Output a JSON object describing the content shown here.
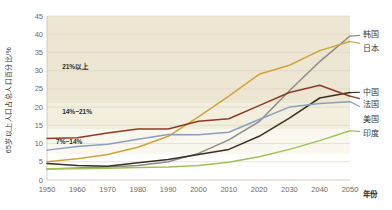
{
  "chart_data": {
    "type": "line",
    "title": "",
    "xlabel": "年份",
    "ylabel": "65岁以上人口占总人口百分比/%",
    "xlim": [
      1950,
      2050
    ],
    "ylim": [
      0,
      45
    ],
    "x": [
      1950,
      1960,
      1970,
      1980,
      1990,
      2000,
      2010,
      2020,
      2030,
      2040,
      2050
    ],
    "xticks": [
      "1950",
      "1960",
      "1970",
      "1980",
      "1990",
      "2000",
      "2010",
      "2020",
      "2030",
      "2040",
      "2050"
    ],
    "yticks": [
      "0",
      "5",
      "10",
      "15",
      "20",
      "25",
      "30",
      "35",
      "40",
      "45"
    ],
    "grid": true,
    "legend_position": "right",
    "series": [
      {
        "name": "韩国",
        "color": "#8d8b85",
        "values": [
          3.0,
          3.3,
          3.6,
          4.0,
          5.0,
          7.3,
          11.0,
          16.0,
          24.5,
          32.5,
          39.5
        ]
      },
      {
        "name": "日本",
        "color": "#d1a23c",
        "values": [
          5.0,
          5.8,
          7.0,
          9.0,
          12.0,
          17.3,
          23.0,
          29.0,
          31.5,
          35.5,
          38.0
        ]
      },
      {
        "name": "中国",
        "color": "#3a2f22",
        "values": [
          4.5,
          4.0,
          3.8,
          4.7,
          5.6,
          7.0,
          8.4,
          12.0,
          17.0,
          22.5,
          24.0
        ]
      },
      {
        "name": "法国",
        "color": "#8c3b22",
        "values": [
          11.4,
          11.6,
          12.9,
          14.0,
          14.0,
          16.1,
          16.8,
          20.4,
          24.0,
          26.0,
          23.0
        ]
      },
      {
        "name": "美国",
        "color": "#8aa0bd",
        "values": [
          8.2,
          9.2,
          9.8,
          11.2,
          12.5,
          12.4,
          13.1,
          16.6,
          20.0,
          21.0,
          21.5
        ]
      },
      {
        "name": "印度",
        "color": "#9dc25a",
        "values": [
          3.1,
          3.1,
          3.2,
          3.4,
          3.6,
          4.0,
          4.9,
          6.4,
          8.4,
          10.8,
          13.5
        ]
      }
    ],
    "bands": [
      {
        "label": "21%以上",
        "from": 21,
        "to": 45,
        "color": "#ece6d2"
      },
      {
        "label": "14%~21%",
        "from": 14,
        "to": 21,
        "color": "#f3efdf"
      },
      {
        "label": "7%~14%",
        "from": 7,
        "to": 14,
        "color": "#faf8ee"
      }
    ],
    "annotations": [
      {
        "text": "21%以上",
        "x": 1955,
        "y": 30.5
      },
      {
        "text": "14%~21%",
        "x": 1955,
        "y": 18.0
      },
      {
        "text": "7%~14%",
        "x": 1953,
        "y": 10.0
      }
    ]
  }
}
